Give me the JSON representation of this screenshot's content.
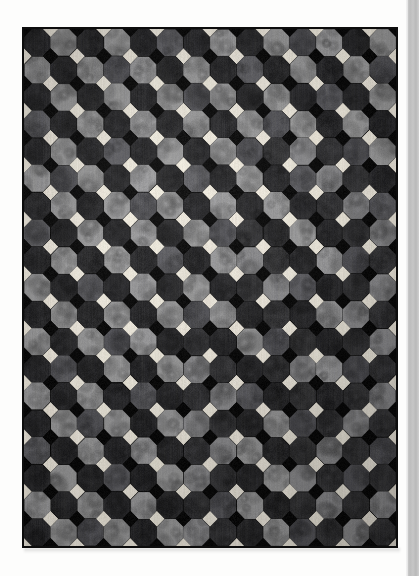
{
  "page": {
    "background_color": "#fdfdfc",
    "edge_strip_color": "#c4c4c4",
    "caption": ""
  },
  "artwork": {
    "title": "Quilt with octagon (snowball) block pattern",
    "description": "Photograph of a pieced quilt laid flat on a white page. A dense grid of octagonal patches in three gray tones is joined at the corners by small alternating black and cream diamonds.",
    "medium": "pieced cotton quilt, photographed",
    "frame": {
      "left": 22,
      "top": 27,
      "width": 376,
      "height": 521,
      "border_color": "#0d0d0d",
      "border_width": 2
    },
    "pattern": {
      "block_name": "snowball / octagon",
      "columns": 14,
      "rows": 19,
      "cell_size": 26.9,
      "octagon_corner_cut": 0.29,
      "joint_diamond_colors": [
        "#0a0a0a",
        "#efeade"
      ],
      "joint_alternation": "checkerboard"
    },
    "palette": {
      "dark": "#2e2e30",
      "dark_alt": "#3a3a3c",
      "medium": "#56565a",
      "medium_alt": "#616165",
      "light": "#8d8d8f",
      "light_alt": "#9a9a9b",
      "seam_black": "#0a0a0a",
      "joint_cream": "#efeade",
      "ground": "#161616"
    },
    "tone_grid": [
      [
        0,
        2,
        0,
        2,
        0,
        1,
        0,
        2,
        0,
        2,
        1,
        2,
        0,
        2
      ],
      [
        2,
        0,
        2,
        1,
        2,
        0,
        2,
        0,
        1,
        0,
        2,
        0,
        2,
        1
      ],
      [
        0,
        2,
        0,
        2,
        0,
        2,
        1,
        2,
        0,
        2,
        0,
        1,
        0,
        2
      ],
      [
        1,
        0,
        2,
        0,
        2,
        0,
        2,
        0,
        2,
        1,
        2,
        0,
        2,
        0
      ],
      [
        0,
        2,
        0,
        1,
        0,
        2,
        0,
        2,
        1,
        0,
        2,
        0,
        1,
        2
      ],
      [
        2,
        1,
        2,
        0,
        2,
        0,
        1,
        0,
        2,
        0,
        1,
        2,
        0,
        0
      ],
      [
        0,
        2,
        0,
        2,
        1,
        2,
        0,
        2,
        0,
        2,
        0,
        0,
        2,
        1
      ],
      [
        1,
        0,
        2,
        0,
        2,
        0,
        2,
        1,
        0,
        0,
        2,
        0,
        0,
        2
      ],
      [
        0,
        2,
        0,
        2,
        0,
        1,
        0,
        2,
        2,
        0,
        0,
        2,
        1,
        0
      ],
      [
        2,
        0,
        1,
        0,
        2,
        0,
        2,
        0,
        0,
        2,
        1,
        0,
        0,
        2
      ],
      [
        0,
        2,
        0,
        2,
        0,
        2,
        1,
        2,
        0,
        0,
        0,
        2,
        2,
        0
      ],
      [
        2,
        0,
        2,
        1,
        2,
        0,
        0,
        0,
        2,
        1,
        0,
        0,
        0,
        2
      ],
      [
        0,
        1,
        0,
        2,
        0,
        2,
        2,
        0,
        0,
        0,
        2,
        2,
        1,
        0
      ],
      [
        2,
        0,
        2,
        0,
        1,
        0,
        0,
        2,
        1,
        0,
        0,
        0,
        0,
        2
      ],
      [
        0,
        2,
        1,
        2,
        0,
        2,
        2,
        0,
        0,
        2,
        1,
        0,
        2,
        0
      ],
      [
        1,
        0,
        2,
        0,
        2,
        0,
        0,
        2,
        2,
        0,
        0,
        2,
        0,
        1
      ],
      [
        0,
        2,
        0,
        1,
        0,
        2,
        2,
        0,
        0,
        2,
        2,
        0,
        1,
        0
      ],
      [
        2,
        0,
        2,
        0,
        2,
        0,
        0,
        1,
        2,
        0,
        0,
        2,
        0,
        2
      ],
      [
        0,
        2,
        1,
        2,
        0,
        2,
        2,
        0,
        0,
        2,
        1,
        0,
        2,
        0
      ]
    ]
  },
  "labels": {
    "figure_alt": "Quilt with octagon snowball pattern in gray tones",
    "page_edge": "page-edge"
  }
}
